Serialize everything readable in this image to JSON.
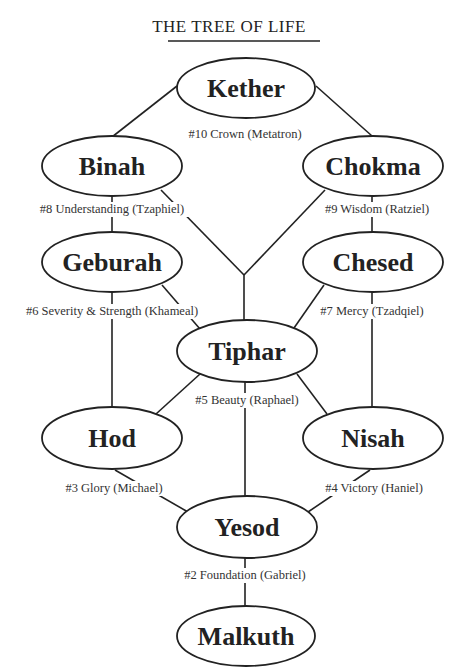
{
  "title": "THE TREE OF LIFE",
  "colors": {
    "stroke": "#222222",
    "background": "#ffffff",
    "text": "#222222"
  },
  "nodes": {
    "kether": {
      "label": "Kether"
    },
    "binah": {
      "label": "Binah"
    },
    "chokma": {
      "label": "Chokma"
    },
    "geburah": {
      "label": "Geburah"
    },
    "chesed": {
      "label": "Chesed"
    },
    "tiphar": {
      "label": "Tiphar"
    },
    "hod": {
      "label": "Hod"
    },
    "nisah": {
      "label": "Nisah"
    },
    "yesod": {
      "label": "Yesod"
    },
    "malkuth": {
      "label": "Malkuth"
    }
  },
  "path_labels": {
    "crown": "#10 Crown (Metatron)",
    "understanding": "#8 Understanding (Tzaphiel)",
    "wisdom": "#9 Wisdom (Ratziel)",
    "severity": "#6 Severity & Strength (Khameal)",
    "mercy": "#7 Mercy (Tzadqiel)",
    "beauty": "#5 Beauty (Raphael)",
    "glory": "#3 Glory (Michael)",
    "victory": "#4 Victory (Haniel)",
    "foundation": "#2 Foundation (Gabriel)"
  }
}
